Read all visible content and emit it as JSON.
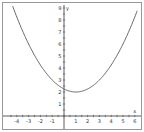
{
  "chart_data": {
    "type": "line",
    "title": "",
    "xlabel": "x",
    "ylabel": "y",
    "xlim": [
      -4.5,
      6.2
    ],
    "ylim": [
      -1,
      9
    ],
    "x_ticks": [
      -4,
      -3,
      -2,
      -1,
      1,
      2,
      3,
      4,
      5,
      6
    ],
    "y_ticks": [
      1,
      2,
      3,
      4,
      5,
      6,
      7,
      8,
      9
    ],
    "grid": false,
    "series": [
      {
        "name": "y = 0.25(x-1)^2 + 2",
        "function": "0.25*(x-1)^2+2",
        "vertex": [
          1,
          2
        ],
        "x": [
          -4.3,
          -4,
          -3,
          -2,
          -1,
          0,
          1,
          2,
          3,
          4,
          5,
          6
        ],
        "y": [
          9.0,
          8.25,
          6,
          4.25,
          3,
          2.25,
          2,
          2.25,
          3,
          4.25,
          6,
          8.25
        ]
      }
    ]
  }
}
